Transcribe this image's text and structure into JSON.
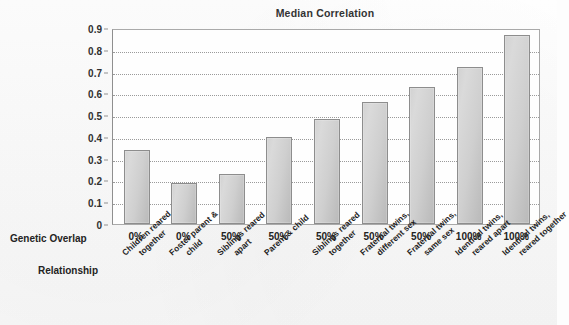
{
  "chart_data": {
    "type": "bar",
    "title": "Median Correlation",
    "xlabel": "",
    "ylabel": "",
    "ylim": [
      0,
      0.9
    ],
    "yticks": [
      "0",
      "0.1",
      "0.2",
      "0.3",
      "0.4",
      "0.5",
      "0.6",
      "0.7",
      "0.8",
      "0.9"
    ],
    "ytick_values": [
      0,
      0.1,
      0.2,
      0.3,
      0.4,
      0.5,
      0.6,
      0.7,
      0.8,
      0.9
    ],
    "grid": true,
    "legend": false,
    "categories": [
      "Children reared together",
      "Foster parent & child",
      "Siblings reared apart",
      "Parent & child",
      "Siblings reared together",
      "Fraternal twins, different sex",
      "Fraternal twins, same sex",
      "Identical twins, reared apart",
      "Identical twins, reared together"
    ],
    "values": [
      0.34,
      0.19,
      0.23,
      0.4,
      0.48,
      0.56,
      0.63,
      0.72,
      0.87
    ],
    "bar_color": "#cfcfcf",
    "bar_border_color": "#8d8d8d"
  },
  "axis_rows": {
    "genetic_overlap_label": "Genetic Overlap",
    "relationship_label": "Relationship",
    "genetic_overlap_values": [
      "0%",
      "0%",
      "50%",
      "50%",
      "50%",
      "50%",
      "50%",
      "100%",
      "100%"
    ],
    "relationship_values": [
      [
        "Children reared",
        "together"
      ],
      [
        "Foster parent &",
        "child"
      ],
      [
        "Siblings reared",
        "apart"
      ],
      [
        "Parent & child",
        ""
      ],
      [
        "Siblings reared",
        "together"
      ],
      [
        "Fraternal twins,",
        "different sex"
      ],
      [
        "Fraternal twins,",
        "same sex"
      ],
      [
        "Identical twins,",
        "reared apart"
      ],
      [
        "Identical twins,",
        "reared together"
      ]
    ]
  }
}
